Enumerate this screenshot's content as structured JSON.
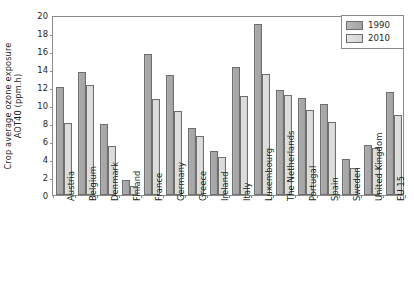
{
  "chart_data": {
    "type": "bar",
    "title": "",
    "xlabel": "",
    "ylabel": "Crop average ozone exposure AOT40 (ppm.h)",
    "ylabel_line1": "Crop average ozone exposure",
    "ylabel_line2": "AOT40 (ppm.h)",
    "ylim": [
      0,
      20
    ],
    "ytick_labels": [
      "20",
      "18",
      "16",
      "14",
      "12",
      "10",
      "8",
      "6",
      "4",
      "2",
      "0"
    ],
    "ytick_values": [
      20,
      18,
      16,
      14,
      12,
      10,
      8,
      6,
      4,
      2,
      0
    ],
    "grid": false,
    "legend_position": "top-right",
    "categories": [
      "Austria",
      "Belgium",
      "Denmark",
      "Finland",
      "France",
      "Germany",
      "Greece",
      "Ireland",
      "Italy",
      "Luxembourg",
      "The Netherlands",
      "Portugal",
      "Spain",
      "Sweden",
      "United Kingdom",
      "EU 15"
    ],
    "series": [
      {
        "name": "1990",
        "color": "#a8a8a8",
        "values": [
          12.0,
          13.7,
          7.9,
          1.7,
          15.7,
          13.3,
          7.5,
          4.9,
          14.2,
          19.0,
          11.7,
          10.8,
          10.1,
          4.0,
          5.6,
          11.5
        ]
      },
      {
        "name": "2010",
        "color": "#dcdcdc",
        "values": [
          8.0,
          12.2,
          5.4,
          1.0,
          10.7,
          9.3,
          6.6,
          4.2,
          11.0,
          13.5,
          11.1,
          9.4,
          8.1,
          3.0,
          5.2,
          8.9
        ]
      }
    ]
  },
  "legend": {
    "entries": [
      {
        "label": "1990"
      },
      {
        "label": "2010"
      }
    ]
  },
  "colors": {
    "series_1990": "#a8a8a8",
    "series_2010": "#dcdcdc",
    "axis": "#8b8b8b",
    "text": "#231f20",
    "background": "#ffffff"
  }
}
